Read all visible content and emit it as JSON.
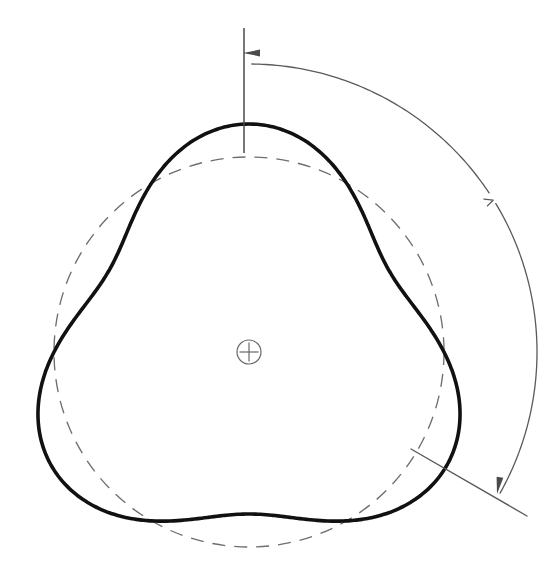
{
  "drawing": {
    "title": "Three-lobed profile with nominal reference circle",
    "background_color": "#ffffff",
    "canvas": {
      "width": 558,
      "height": 566
    },
    "center": {
      "x": 249,
      "y": 352,
      "label": "+"
    },
    "elements": {
      "profile_outline": {
        "name": "three-lobed-profile",
        "stroke_color": "#111111",
        "stroke_width": 3.6,
        "style": "solid-thick",
        "lobe_count": 3,
        "max_radius": 228,
        "min_radius": 162,
        "lobe_peak_angles_deg": [
          90,
          210,
          330
        ],
        "lobe_valley_angles_deg": [
          30,
          150,
          270
        ],
        "extreme_points": {
          "top_peak": {
            "x": 247,
            "y": 112
          },
          "left_peak": {
            "x": 22,
            "y": 420
          },
          "right_peak": {
            "x": 470,
            "y": 412
          }
        }
      },
      "reference_circle": {
        "name": "nominal-reference-circle",
        "stroke_color": "#6e6e6e",
        "stroke_width": 1.35,
        "style": "dashed",
        "dash_pattern": "13 9",
        "radius": 195,
        "top": {
          "x": 249,
          "y": 157
        },
        "bottom": {
          "x": 249,
          "y": 547
        },
        "left": {
          "x": 54,
          "y": 352
        },
        "right": {
          "x": 444,
          "y": 352
        }
      },
      "center_mark": {
        "name": "center-mark",
        "stroke_color": "#6a6a6a",
        "circle_radius": 12,
        "cross_length": 19,
        "glyph": "+"
      },
      "vertical_center_line": {
        "name": "vertical-center-line",
        "stroke_color": "#4a4a4a",
        "stroke_width": 1.5,
        "from": {
          "x": 244,
          "y": 28
        },
        "to": {
          "x": 244,
          "y": 153
        }
      },
      "dimension_arc": {
        "name": "angular-dimension-arc",
        "stroke_color": "#5a5a5a",
        "stroke_width": 1.3,
        "start": {
          "x": 252,
          "y": 54
        },
        "end": {
          "x": 498,
          "y": 492
        },
        "radius": 288,
        "sweep_description": "arc sweeping clockwise from top centerline to lower-right leader",
        "break_mark": {
          "x": 488,
          "y": 201,
          "glyph_like": "lambda"
        }
      },
      "arrowheads": [
        {
          "name": "arrowhead-top-left",
          "tip": {
            "x": 243,
            "y": 53
          },
          "direction": "left",
          "fill": "#4a4a4a",
          "length": 17,
          "half_width": 3.4
        },
        {
          "name": "arrowhead-bottom-right",
          "tip": {
            "x": 497,
            "y": 494
          },
          "direction": "down",
          "fill": "#4a4a4a",
          "length": 17,
          "half_width": 3.4
        }
      ],
      "leader_line": {
        "name": "lower-right-leader-line",
        "stroke_color": "#5a5a5a",
        "stroke_width": 1.4,
        "from": {
          "x": 411,
          "y": 449
        },
        "to": {
          "x": 527,
          "y": 516
        },
        "angle_deg": 30
      }
    },
    "annotations": {
      "has_text_labels": false,
      "note": "No dimension text values are printed in the drawing"
    }
  }
}
